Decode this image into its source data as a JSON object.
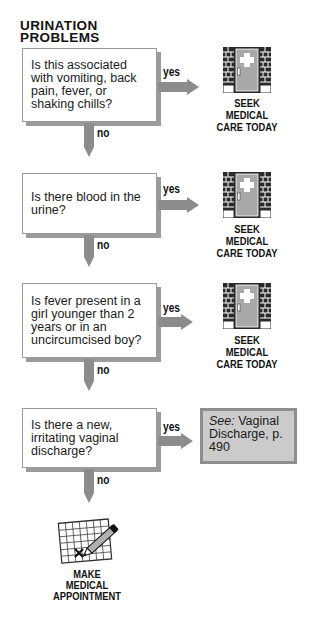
{
  "title": {
    "line1": "URINATION",
    "line2": "PROBLEMS"
  },
  "colors": {
    "arrow": "#8c8c8c",
    "box_shadow": "#9b9b9b",
    "see_box_fill": "#cbcbcb",
    "see_box_border": "#8e8e8e"
  },
  "steps": [
    {
      "question": "Is this associated with vomiting, back pain, fever, or shaking chills?",
      "yes_label": "yes",
      "no_label": "no",
      "outcome": {
        "icon": "medical-door-icon",
        "line1": "SEEK",
        "line2": "MEDICAL",
        "line3": "CARE TODAY"
      }
    },
    {
      "question": "Is there blood in the urine?",
      "yes_label": "yes",
      "no_label": "no",
      "outcome": {
        "icon": "medical-door-icon",
        "line1": "SEEK",
        "line2": "MEDICAL",
        "line3": "CARE TODAY"
      }
    },
    {
      "question": "Is fever present in a girl younger than 2 years or in an uncircumcised boy?",
      "yes_label": "yes",
      "no_label": "no",
      "outcome": {
        "icon": "medical-door-icon",
        "line1": "SEEK",
        "line2": "MEDICAL",
        "line3": "CARE TODAY"
      }
    },
    {
      "question": "Is there a new, irritating vaginal discharge?",
      "yes_label": "yes",
      "no_label": "no",
      "outcome": {
        "see_prefix": "See:",
        "see_text": " Vaginal Discharge, p. 490"
      }
    }
  ],
  "final": {
    "icon": "calendar-pencil-icon",
    "line1": "MAKE",
    "line2": "MEDICAL",
    "line3": "APPOINTMENT"
  }
}
